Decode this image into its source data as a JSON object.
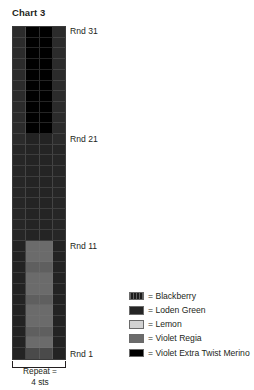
{
  "chart_title": "Chart 3",
  "repeat": {
    "line1": "Repeat =",
    "line2": "4 sts"
  },
  "round_labels": [
    {
      "text": "Rnd 31",
      "round": 31
    },
    {
      "text": "Rnd 21",
      "round": 21
    },
    {
      "text": "Rnd 11",
      "round": 11
    },
    {
      "text": "Rnd 1",
      "round": 1
    }
  ],
  "legend": {
    "items": [
      {
        "label": "= Blackberry",
        "color": "#1c1c1c",
        "pattern": "striped"
      },
      {
        "label": "= Loden Green",
        "color": "#252525",
        "pattern": "solid"
      },
      {
        "label": "= Lemon",
        "color": "#d2d2d2",
        "pattern": "solid"
      },
      {
        "label": "= Violet Regia",
        "color": "#6b6b6b",
        "pattern": "solid"
      },
      {
        "label": "= Violet Extra Twist Merino",
        "color": "#000000",
        "pattern": "solid"
      }
    ]
  },
  "chart_data": {
    "type": "heatmap",
    "title": "Chart 3",
    "xlabel": "Repeat = 4 sts",
    "ylabel": "",
    "columns": 4,
    "rows": 31,
    "x": [
      1,
      2,
      3,
      4
    ],
    "grid_on": true,
    "legend_position": "right-bottom",
    "annotations": [
      "Rnd 31",
      "Rnd 21",
      "Rnd 11",
      "Rnd 1",
      "Repeat = 4 sts"
    ],
    "color_key": {
      "blackberry": "#1c1c1c",
      "loden_green": "#252525",
      "lemon": "#d2d2d2",
      "violet_regia": "#6b6b6b",
      "violet_extra_twist_merino": "#000000"
    },
    "rows_top_to_bottom": [
      {
        "round": 31,
        "cells": [
          "#2b2b2b",
          "#000000",
          "#000000",
          "#2b2b2b"
        ]
      },
      {
        "round": 30,
        "cells": [
          "#2b2b2b",
          "#000000",
          "#000000",
          "#2b2b2b"
        ]
      },
      {
        "round": 29,
        "cells": [
          "#2b2b2b",
          "#000000",
          "#000000",
          "#2b2b2b"
        ]
      },
      {
        "round": 28,
        "cells": [
          "#2b2b2b",
          "#000000",
          "#000000",
          "#2b2b2b"
        ]
      },
      {
        "round": 27,
        "cells": [
          "#2b2b2b",
          "#000000",
          "#000000",
          "#2b2b2b"
        ]
      },
      {
        "round": 26,
        "cells": [
          "#2b2b2b",
          "#000000",
          "#000000",
          "#2b2b2b"
        ]
      },
      {
        "round": 25,
        "cells": [
          "#2b2b2b",
          "#000000",
          "#000000",
          "#2b2b2b"
        ]
      },
      {
        "round": 24,
        "cells": [
          "#2b2b2b",
          "#000000",
          "#000000",
          "#2b2b2b"
        ]
      },
      {
        "round": 23,
        "cells": [
          "#2b2b2b",
          "#000000",
          "#000000",
          "#2b2b2b"
        ]
      },
      {
        "round": 22,
        "cells": [
          "#2b2b2b",
          "#000000",
          "#000000",
          "#2b2b2b"
        ]
      },
      {
        "round": 21,
        "cells": [
          "#2b2b2b",
          "#232323",
          "#232323",
          "#2b2b2b"
        ]
      },
      {
        "round": 20,
        "cells": [
          "#262626",
          "#242424",
          "#242424",
          "#262626"
        ]
      },
      {
        "round": 19,
        "cells": [
          "#262626",
          "#242424",
          "#242424",
          "#262626"
        ]
      },
      {
        "round": 18,
        "cells": [
          "#262626",
          "#242424",
          "#242424",
          "#262626"
        ]
      },
      {
        "round": 17,
        "cells": [
          "#262626",
          "#242424",
          "#242424",
          "#262626"
        ]
      },
      {
        "round": 16,
        "cells": [
          "#262626",
          "#242424",
          "#242424",
          "#262626"
        ]
      },
      {
        "round": 15,
        "cells": [
          "#262626",
          "#242424",
          "#242424",
          "#262626"
        ]
      },
      {
        "round": 14,
        "cells": [
          "#262626",
          "#242424",
          "#242424",
          "#262626"
        ]
      },
      {
        "round": 13,
        "cells": [
          "#262626",
          "#242424",
          "#242424",
          "#262626"
        ]
      },
      {
        "round": 12,
        "cells": [
          "#262626",
          "#242424",
          "#242424",
          "#262626"
        ]
      },
      {
        "round": 11,
        "cells": [
          "#232323",
          "#6b6b6b",
          "#6b6b6b",
          "#232323"
        ]
      },
      {
        "round": 10,
        "cells": [
          "#232323",
          "#6b6b6b",
          "#6b6b6b",
          "#232323"
        ]
      },
      {
        "round": 9,
        "cells": [
          "#232323",
          "#5f5f5f",
          "#5f5f5f",
          "#232323"
        ]
      },
      {
        "round": 8,
        "cells": [
          "#232323",
          "#6b6b6b",
          "#6b6b6b",
          "#232323"
        ]
      },
      {
        "round": 7,
        "cells": [
          "#232323",
          "#6b6b6b",
          "#6b6b6b",
          "#232323"
        ]
      },
      {
        "round": 6,
        "cells": [
          "#232323",
          "#5f5f5f",
          "#5f5f5f",
          "#232323"
        ]
      },
      {
        "round": 5,
        "cells": [
          "#232323",
          "#6b6b6b",
          "#6b6b6b",
          "#232323"
        ]
      },
      {
        "round": 4,
        "cells": [
          "#232323",
          "#6b6b6b",
          "#6b6b6b",
          "#232323"
        ]
      },
      {
        "round": 3,
        "cells": [
          "#232323",
          "#5f5f5f",
          "#5f5f5f",
          "#232323"
        ]
      },
      {
        "round": 2,
        "cells": [
          "#232323",
          "#6b6b6b",
          "#6b6b6b",
          "#232323"
        ]
      },
      {
        "round": 1,
        "cells": [
          "#232323",
          "#4a4a4a",
          "#4a4a4a",
          "#232323"
        ]
      }
    ]
  }
}
